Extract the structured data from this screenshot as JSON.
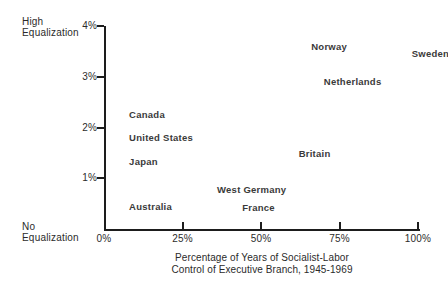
{
  "chart_data": {
    "type": "scatter",
    "title": "",
    "xlabel": "Percentage of Years of Socialist-Labor Control of Executive Branch, 1945-1969",
    "xlabel_line1": "Percentage of Years of Socialist-Labor",
    "xlabel_line2": "Control of Executive Branch, 1945-1969",
    "ylabel": "",
    "xlim": [
      0,
      100
    ],
    "ylim": [
      0,
      4
    ],
    "grid": false,
    "legend": null,
    "x_ticks": [
      "0%",
      "25%",
      "50%",
      "75%",
      "100%"
    ],
    "x_tick_values": [
      0,
      25,
      50,
      75,
      100
    ],
    "y_ticks": [
      "1%",
      "2%",
      "3%",
      "4%"
    ],
    "y_tick_values": [
      1,
      2,
      3,
      4
    ],
    "y_axis_high_label_line1": "High",
    "y_axis_high_label_line2": "Equalization",
    "y_axis_low_label_line1": "No",
    "y_axis_low_label_line2": "Equalization",
    "points": [
      {
        "label": "Canada",
        "x": 8,
        "y": 2.25
      },
      {
        "label": "United States",
        "x": 8,
        "y": 1.8
      },
      {
        "label": "Japan",
        "x": 8,
        "y": 1.33
      },
      {
        "label": "Australia",
        "x": 8,
        "y": 0.43
      },
      {
        "label": "West Germany",
        "x": 36,
        "y": 0.76
      },
      {
        "label": "France",
        "x": 44,
        "y": 0.41
      },
      {
        "label": "Britain",
        "x": 62,
        "y": 1.48
      },
      {
        "label": "Netherlands",
        "x": 70,
        "y": 2.9
      },
      {
        "label": "Norway",
        "x": 66,
        "y": 3.59
      },
      {
        "label": "Sweden",
        "x": 98,
        "y": 3.45
      }
    ]
  },
  "colors": {
    "axis": "#1d1d1d",
    "text": "#2b2b2b",
    "point_label": "#3a3a3a",
    "background": "#ffffff"
  }
}
